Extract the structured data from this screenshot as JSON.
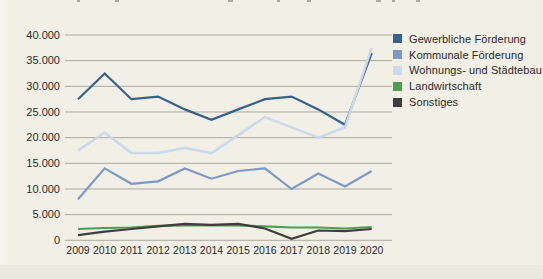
{
  "page": {
    "background": "#f1efe6",
    "bottom_strip_color": "#eae8df",
    "note": "scanned printed line chart, title line cropped off at top edge"
  },
  "chart_data": {
    "type": "line",
    "x": [
      2009,
      2010,
      2011,
      2012,
      2013,
      2014,
      2015,
      2016,
      2017,
      2018,
      2019,
      2020
    ],
    "series": [
      {
        "name": "Gewerbliche Förderung",
        "color": "#35618f",
        "values": [
          27500,
          32500,
          27500,
          28000,
          25500,
          23500,
          25500,
          27500,
          28000,
          25500,
          22500,
          36500
        ]
      },
      {
        "name": "Kommunale Förderung",
        "color": "#7e99c6",
        "values": [
          8000,
          14000,
          11000,
          11500,
          14000,
          12000,
          13500,
          14000,
          10000,
          13000,
          10500,
          13500
        ]
      },
      {
        "name": "Wohnungs- und Städtebau",
        "color": "#cbd9ea",
        "values": [
          17500,
          21000,
          17000,
          17000,
          18000,
          17000,
          20500,
          24000,
          22000,
          20000,
          22000,
          37500
        ]
      },
      {
        "name": "Landwirtschaft",
        "color": "#4d9e53",
        "values": [
          2200,
          2400,
          2500,
          2800,
          2900,
          2900,
          2900,
          2700,
          2500,
          2500,
          2300,
          2600
        ]
      },
      {
        "name": "Sonstiges",
        "color": "#3e3f3c",
        "values": [
          1000,
          1700,
          2200,
          2700,
          3200,
          3000,
          3200,
          2300,
          300,
          1900,
          1800,
          2200
        ]
      }
    ],
    "ylim": [
      0,
      40000
    ],
    "ytick_step": 5000,
    "ytick_labels": [
      "40.000",
      "35.000",
      "30.000",
      "25.000",
      "20.000",
      "15.000",
      "10.000",
      "5.000",
      "0"
    ],
    "grid": true,
    "gridline_color": "#a5a295",
    "axis_label_color": "#2e2d2a",
    "legend_position": "top-right"
  }
}
